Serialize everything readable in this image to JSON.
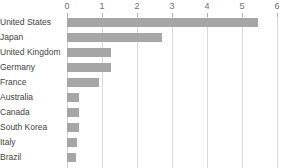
{
  "chart_data": {
    "type": "bar",
    "orientation": "horizontal",
    "title": "",
    "subtitle": "",
    "xlabel": "",
    "ylabel": "",
    "xlim": [
      0,
      6
    ],
    "ylim": null,
    "grid": true,
    "grid_axis": "x",
    "legend": false,
    "legend_position": "none",
    "xticks": [
      0,
      1,
      2,
      3,
      4,
      5,
      6
    ],
    "xtick_labels": [
      "0",
      "1",
      "2",
      "3",
      "4",
      "5",
      "6"
    ],
    "xaxis_position": "top",
    "categories": [
      "United States",
      "Japan",
      "United Kingdom",
      "Germany",
      "France",
      "Australia",
      "Canada",
      "South Korea",
      "Italy",
      "Brazil"
    ],
    "values": [
      5.45,
      2.72,
      1.27,
      1.25,
      0.9,
      0.35,
      0.34,
      0.33,
      0.29,
      0.26
    ],
    "series": [
      {
        "name": "Value",
        "color": "#a6a6a6",
        "values": [
          5.45,
          2.72,
          1.27,
          1.25,
          0.9,
          0.35,
          0.34,
          0.33,
          0.29,
          0.26
        ]
      }
    ]
  },
  "style": {
    "bar_color": "#a6a6a6",
    "grid_color": "#d9d9d9",
    "tick_label_color": "#6e6e6e",
    "category_label_color": "#3f3f3f",
    "background_color": "#ffffff"
  }
}
